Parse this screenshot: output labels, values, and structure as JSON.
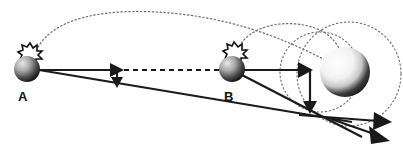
{
  "figure": {
    "background_color": "#ffffff",
    "stroke_color": "#1a1a1a",
    "dotted_color": "#6b6b6b",
    "width": 403,
    "height": 149
  },
  "labels": {
    "point_a": "A",
    "point_b": "B"
  },
  "bodies": [
    {
      "name": "small-body-a",
      "label": "A",
      "cx": 27,
      "cy": 69,
      "r": 13,
      "kind": "shaded-sphere",
      "highlight": "upper-left",
      "burst": {
        "cx": 30,
        "cy": 52,
        "r": 8,
        "points": 11
      },
      "label_x": 18,
      "label_y": 100
    },
    {
      "name": "small-body-b",
      "label": "B",
      "cx": 232,
      "cy": 69,
      "r": 13,
      "kind": "shaded-sphere",
      "highlight": "upper-left",
      "burst": {
        "cx": 232,
        "cy": 52,
        "r": 8,
        "points": 11
      },
      "label_x": 225,
      "label_y": 100
    },
    {
      "name": "large-body-planet",
      "label": "",
      "cx": 345,
      "cy": 72,
      "r": 25,
      "kind": "shaded-sphere",
      "highlight": "upper-left",
      "burst": null,
      "label_x": 0,
      "label_y": 0
    }
  ],
  "dotted_circles": [
    {
      "name": "inner-dotted-orbit",
      "cx": 320,
      "cy": 72,
      "rx": 40,
      "ry": 40
    },
    {
      "name": "outer-dotted-orbit",
      "cx": 349,
      "cy": 74,
      "rx": 52,
      "ry": 52
    }
  ],
  "dotted_paths": [
    {
      "name": "dotted-arc-a-to-planet",
      "d": "M 34 58 C 44 16 110 6 180 14 C 250 22 300 46 344 70"
    },
    {
      "name": "dotted-arc-b-to-planet",
      "d": "M 238 50 C 246 26 288 16 320 30 C 340 40 344 58 344 70"
    }
  ],
  "solid_paths": [
    {
      "name": "velocity-vector-a-horizontal",
      "d": "M 39 70 L 110 70",
      "arrowhead": "right",
      "arrow_x": 118,
      "arrow_y": 70
    },
    {
      "name": "dashed-reference-line-a-to-b",
      "d": "M 122 70 L 219 70",
      "dashed": true
    },
    {
      "name": "delta-v-vector-a-down",
      "d": "M 117 70 L 117 80",
      "arrowhead": "down",
      "arrow_x": 117,
      "arrow_y": 86
    },
    {
      "name": "trajectory-line-a-to-exit",
      "d": "M 39 70 L 352 122"
    },
    {
      "name": "velocity-vector-b-horizontal",
      "d": "M 244 70 L 303 70",
      "arrowhead": "right",
      "arrow_x": 311,
      "arrow_y": 70
    },
    {
      "name": "delta-v-vector-b-down",
      "d": "M 310 72 L 310 104",
      "arrowhead": "down",
      "arrow_x": 310,
      "arrow_y": 112
    },
    {
      "name": "trajectory-line-b-to-exit",
      "d": "M 242 74 L 360 136"
    },
    {
      "name": "exit-vector-upper",
      "d": "M 300 116 L 380 122",
      "arrowhead": "right",
      "arrow_x": 388,
      "arrow_y": 122
    },
    {
      "name": "exit-vector-lower",
      "d": "M 330 120 L 378 136",
      "arrowhead": "down-right",
      "arrow_x": 386,
      "arrow_y": 140
    }
  ]
}
